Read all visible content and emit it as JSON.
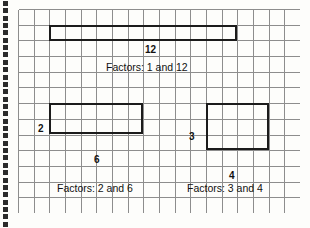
{
  "page": {
    "type": "grid-paper-worksheet",
    "title_visible": false,
    "background_color": "#fdfdfb",
    "grid_line_color": "#8d8d8d",
    "rect_stroke_color": "#1b1b1b",
    "text_color": "#111111"
  },
  "binding": {
    "name": "spiral-punch-holes",
    "hole_count": 31,
    "hole_color": "#2b2b2b"
  },
  "grid": {
    "columns": 18,
    "rows": 13,
    "cell_size_px": 15.7,
    "origin_x_px": 18,
    "origin_y_px": 9
  },
  "arrays": [
    {
      "id": "array-1x12",
      "rows": 1,
      "cols": 12,
      "product": 12,
      "col_label": "12",
      "row_label": "",
      "factors_label": "Factors: 1 and 12",
      "grid_col_start": 2,
      "grid_row_start": 1
    },
    {
      "id": "array-2x6",
      "rows": 2,
      "cols": 6,
      "product": 12,
      "col_label": "6",
      "row_label": "2",
      "factors_label": "Factors: 2 and 6",
      "grid_col_start": 2,
      "grid_row_start": 6
    },
    {
      "id": "array-3x4",
      "rows": 3,
      "cols": 4,
      "product": 12,
      "col_label": "4",
      "row_label": "3",
      "factors_label": "Factors: 3 and 4",
      "grid_col_start": 12,
      "grid_row_start": 6
    }
  ],
  "chart_data": {
    "type": "table",
    "columns": [
      "rows",
      "columns",
      "product",
      "factors_label"
    ],
    "rows": [
      [
        1,
        12,
        12,
        "Factors: 1 and 12"
      ],
      [
        2,
        6,
        12,
        "Factors: 2 and 6"
      ],
      [
        3,
        4,
        12,
        "Factors: 3 and 4"
      ]
    ],
    "xlabel": "",
    "ylabel": "",
    "grid": true,
    "legend": "none"
  }
}
